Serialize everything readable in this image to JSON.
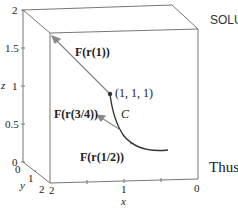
{
  "figure": {
    "axes": {
      "z_label": "z",
      "y_label": "y",
      "x_label": "x",
      "z_ticks": [
        "0",
        "0.5",
        "1",
        "1.5",
        "2"
      ],
      "y_ticks": [
        "0",
        "1",
        "2"
      ],
      "x_ticks": [
        "2",
        "1",
        "0"
      ]
    },
    "point_label": "(1, 1, 1)",
    "curve_label": "C",
    "vector_labels": {
      "f1": "F(r(1))",
      "f34": "F(r(3/4))",
      "f12": "F(r(1/2))"
    },
    "side_text": {
      "heading": "SOLU",
      "body": "Thus"
    },
    "colors": {
      "box": "#777777",
      "curve": "#333333",
      "vector": "#888888"
    }
  }
}
